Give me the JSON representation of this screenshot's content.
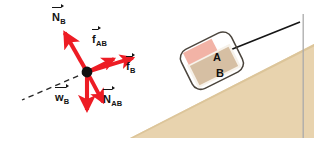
{
  "figure": {
    "colors": {
      "vector_red": "#ED1C24",
      "incline_fill": "#E8D3AE",
      "block_a_fill": "#F2B3A6",
      "block_b_fill": "#D6BFA3",
      "block_b_border": "#F7F2EA",
      "system_outline": "#4A443C",
      "rope": "#161616",
      "dot": "#111111",
      "frame_line": "#AAAAAA",
      "label_ink": "#131313"
    }
  },
  "free_body_diagram": {
    "name": "free-body-diagram-block-B",
    "origin_dot_label": "",
    "incline_axis_style": "dashed",
    "vectors": [
      {
        "key": "N_B",
        "symbol": "N",
        "subscript": "B",
        "label_text": "N",
        "description": "normal force on B from incline surface",
        "direction_deg": 119,
        "length_px": 46,
        "label_x": 52,
        "label_y": 8,
        "bar_width_px": 9
      },
      {
        "key": "f_AB",
        "symbol": "f",
        "subscript": "AB",
        "label_text": "f",
        "description": "friction force on B from A",
        "direction_deg": 26,
        "length_px": 30,
        "label_x": 92,
        "label_y": 30,
        "bar_width_px": 6
      },
      {
        "key": "f_B",
        "symbol": "f",
        "subscript": "B",
        "label_text": "f",
        "description": "friction force on B from incline surface",
        "direction_deg": 17,
        "length_px": 48,
        "label_x": 126,
        "label_y": 57,
        "bar_width_px": 6
      },
      {
        "key": "N_AB",
        "symbol": "N",
        "subscript": "AB",
        "label_text": "N",
        "description": "normal force on B from A",
        "direction_deg": -62,
        "length_px": 34,
        "label_x": 103,
        "label_y": 90,
        "bar_width_px": 9
      },
      {
        "key": "w_B",
        "symbol": "w",
        "subscript": "B",
        "label_text": "w",
        "description": "weight of block B",
        "direction_deg": -90,
        "length_px": 38,
        "label_x": 55,
        "label_y": 88,
        "bar_width_px": 11
      }
    ]
  },
  "scenario": {
    "name": "inclined-plane-scenario",
    "incline": {
      "label": "",
      "surface_description": "inclined plane rising to the right"
    },
    "blocks": [
      {
        "key": "A",
        "label": "A",
        "label_x": 213,
        "label_y": 52,
        "description": "upper block A"
      },
      {
        "key": "B",
        "label": "B",
        "label_x": 216,
        "label_y": 68,
        "description": "lower block B"
      }
    ],
    "rope": {
      "label": "",
      "description": "rope from block A up the incline to the right"
    },
    "system_boundary": {
      "label": "",
      "description": "rounded outline enclosing blocks A and B as one system"
    }
  }
}
